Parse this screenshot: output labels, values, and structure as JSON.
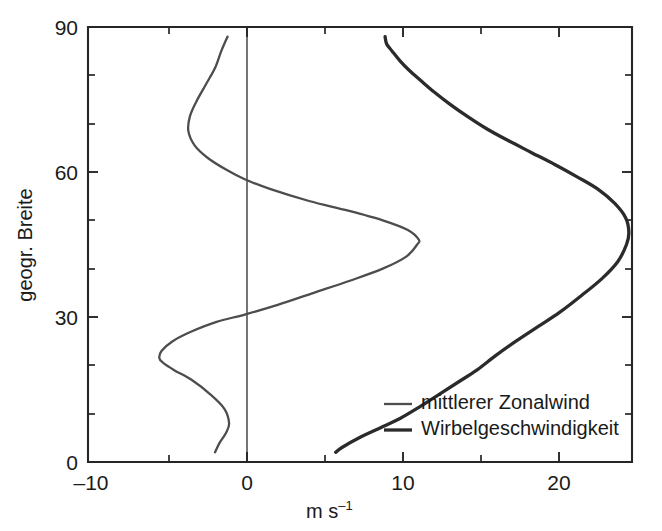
{
  "chart_data": {
    "type": "line",
    "title": "",
    "subtitle": "",
    "xlabel": "m s",
    "xlabel_exponent": "–1",
    "xlabel_full": "m s⁻¹",
    "ylabel": "geogr. Breite",
    "xlim": [
      -10,
      24.7
    ],
    "ylim": [
      0,
      90
    ],
    "grid": false,
    "orientation": "horizontal-value-vertical-latitude",
    "x_ticks_major": [
      -10,
      0,
      10,
      20
    ],
    "x_ticklabels": [
      "–10",
      "0",
      "10",
      "20"
    ],
    "x_ticks_minor": [
      -5,
      5,
      15
    ],
    "y_ticks_major": [
      0,
      30,
      60,
      90
    ],
    "y_ticklabels": [
      "0",
      "30",
      "60",
      "90"
    ],
    "y_ticks_minor": [
      10,
      20,
      40,
      50,
      70,
      80
    ],
    "zero_reference_line": 0,
    "legend_position": "bottom-right-inside",
    "series": [
      {
        "name": "mittlerer Zonalwind",
        "style": "thin",
        "color": "#4d4d4d",
        "x": [
          -1.9,
          -1.6,
          -1.2,
          -1.0,
          -1.3,
          -2.2,
          -3.4,
          -4.5,
          -5.2,
          -5.45,
          -5.3,
          -4.6,
          -3.4,
          -1.8,
          0.0,
          2.1,
          4.4,
          6.7,
          8.8,
          10.3,
          11.0,
          11.1,
          10.4,
          8.8,
          6.6,
          4.1,
          1.6,
          0.0,
          -1.2,
          -2.4,
          -3.2,
          -3.6,
          -3.5,
          -3.1,
          -2.5,
          -1.9,
          -1.5,
          -1.1
        ],
        "y": [
          2,
          4,
          6,
          8,
          11,
          14,
          17,
          19,
          20.5,
          21.5,
          23,
          25,
          27,
          29,
          30.5,
          32.5,
          35,
          37.5,
          40,
          42.5,
          45,
          46,
          48,
          50,
          52,
          54,
          56.5,
          58.5,
          60.5,
          63,
          65.5,
          68.5,
          71.5,
          74.5,
          78,
          81.5,
          85,
          88
        ]
      },
      {
        "name": "Wirbelgeschwindigkeit",
        "style": "thick",
        "color": "#2b2b2b",
        "x": [
          5.8,
          6.2,
          7.3,
          8.6,
          9.9,
          11.2,
          12.4,
          13.6,
          14.8,
          16.0,
          17.3,
          18.7,
          20.1,
          21.5,
          22.8,
          23.8,
          24.35,
          24.5,
          24.3,
          23.6,
          22.5,
          21.2,
          19.8,
          18.3,
          16.8,
          15.4,
          14.2,
          13.1,
          12.1,
          11.2,
          10.5,
          9.9,
          9.4,
          9.05,
          8.95
        ],
        "y": [
          2,
          3,
          5,
          7,
          9,
          11.5,
          14,
          16.5,
          19,
          22,
          25,
          28,
          31,
          34.5,
          38,
          41.5,
          45,
          47.5,
          50.5,
          53.5,
          56.5,
          59,
          61.5,
          64,
          66.5,
          69,
          71.5,
          74,
          76.5,
          79,
          81,
          83,
          85,
          86.5,
          88
        ]
      }
    ],
    "legend": [
      {
        "label": "mittlerer Zonalwind",
        "style": "thin"
      },
      {
        "label": "Wirbelgeschwindigkeit",
        "style": "thick"
      }
    ]
  },
  "figure": {
    "background_color": "#ffffff",
    "axis_color": "#262626"
  }
}
